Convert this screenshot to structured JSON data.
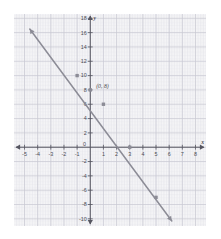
{
  "chart_data": {
    "type": "line",
    "title": "",
    "xlabel": "x",
    "ylabel": "y",
    "xlim": [
      -5.8,
      8.8
    ],
    "ylim": [
      -11.0,
      18.6
    ],
    "x_ticks": [
      -5,
      -4,
      -3,
      -2,
      -1,
      0,
      1,
      2,
      3,
      4,
      5,
      6,
      7,
      8
    ],
    "x_tick_labels": [
      "-5",
      "-4",
      "-3",
      "-2",
      "-1",
      "0",
      "1",
      "2",
      "3",
      "4",
      "5",
      "6",
      "7",
      "8"
    ],
    "y_ticks": [
      -10,
      -8,
      -6,
      -4,
      -2,
      2,
      4,
      6,
      8,
      10,
      12,
      14,
      16,
      18
    ],
    "y_tick_labels": [
      "-10",
      "-8",
      "-6",
      "-4",
      "-2",
      "2",
      "4",
      "6",
      "8",
      "10",
      "12",
      "14",
      "16",
      "18"
    ],
    "grid": true,
    "grid_minor_step": 0.2,
    "grid_major_step": 1,
    "legend": null,
    "series": [
      {
        "name": "line",
        "type": "line",
        "slope": -1.85,
        "intercept": 8,
        "endpoints": [
          [
            -4.6,
            16.5
          ],
          [
            6.2,
            -10.3
          ]
        ],
        "arrow_start": true,
        "arrow_end": true,
        "points": [
          [
            -1,
            10
          ],
          [
            0,
            8
          ],
          [
            1,
            6
          ],
          [
            3,
            0
          ],
          [
            5,
            -7
          ]
        ]
      }
    ],
    "annotations": [
      {
        "text": "(0, 8)",
        "x": 0.45,
        "y": 8.3,
        "style": "italic"
      }
    ],
    "colors": {
      "line": "#8c8c96",
      "point": "#8c8c96",
      "axis": "#555560",
      "grid_minor": "#e3e3e8",
      "grid_major": "#c9c9d2",
      "tick_label": "#4a4a52",
      "background": "#fbfbfb",
      "page_background": "#ffffff"
    }
  },
  "axes": {
    "x_axis_label": "x",
    "y_axis_label": "y",
    "origin_label": "0"
  }
}
